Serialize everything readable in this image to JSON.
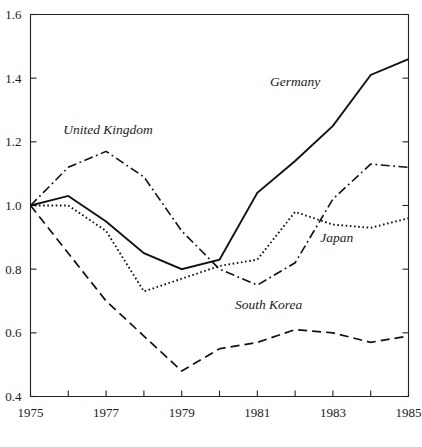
{
  "figure": {
    "background_color": "#ffffff",
    "ink_color": "#111111",
    "axis_color": "#222222"
  },
  "chart_data": {
    "type": "line",
    "title": "",
    "subtitle": "",
    "xlabel": "",
    "ylabel": "",
    "xlim": [
      1975,
      1985
    ],
    "ylim": [
      0.4,
      1.6
    ],
    "grid": false,
    "legend_position": "inline-annotations",
    "x": [
      1975,
      1976,
      1977,
      1978,
      1979,
      1980,
      1981,
      1982,
      1983,
      1984,
      1985
    ],
    "xticks": [
      1975,
      1976,
      1977,
      1978,
      1979,
      1980,
      1981,
      1982,
      1983,
      1984,
      1985
    ],
    "xtick_labels": [
      "1975",
      "",
      "1977",
      "",
      "1979",
      "",
      "1981",
      "",
      "1983",
      "",
      "1985"
    ],
    "yticks": [
      0.4,
      0.6,
      0.8,
      1.0,
      1.2,
      1.4,
      1.6
    ],
    "ytick_labels": [
      "0.4",
      "0.6",
      "0.8",
      "1.0",
      "1.2",
      "1.4",
      "1.6"
    ],
    "series": [
      {
        "name": "Germany",
        "style": "solid",
        "label_x": 1982.0,
        "label_y": 1.375,
        "values": [
          1.0,
          1.03,
          0.95,
          0.85,
          0.8,
          0.83,
          1.04,
          1.14,
          1.25,
          1.41,
          1.46
        ]
      },
      {
        "name": "United Kingdom",
        "style": "dash-dot",
        "label_x": 1977.05,
        "label_y": 1.225,
        "values": [
          1.0,
          1.12,
          1.17,
          1.09,
          0.92,
          0.8,
          0.75,
          0.82,
          1.02,
          1.13,
          1.12
        ]
      },
      {
        "name": "Japan",
        "style": "dotted",
        "label_x": 1983.1,
        "label_y": 0.885,
        "values": [
          1.0,
          1.0,
          0.92,
          0.73,
          0.77,
          0.81,
          0.83,
          0.98,
          0.94,
          0.93,
          0.96
        ]
      },
      {
        "name": "South Korea",
        "style": "dashed",
        "label_x": 1981.3,
        "label_y": 0.675,
        "values": [
          1.0,
          0.85,
          0.7,
          0.59,
          0.48,
          0.55,
          0.57,
          0.61,
          0.6,
          0.57,
          0.59
        ]
      }
    ]
  }
}
